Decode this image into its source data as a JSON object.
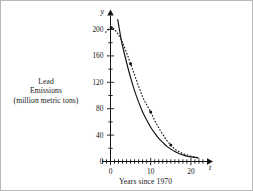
{
  "figure": {
    "background_color": "#ffffff",
    "border_color": "#b9b9b9",
    "left_caption_line1": "Lead",
    "left_caption_line2": "Emissions",
    "left_caption_line3": "(million metric tons)",
    "bottom_caption": "Years since 1970",
    "y_axis_name": "y",
    "x_axis_name": "t"
  },
  "chart_data": {
    "type": "line",
    "title": "",
    "xlabel": "Years since 1970",
    "ylabel": "Lead Emissions (million metric tons)",
    "xlim": [
      -2,
      24
    ],
    "ylim": [
      0,
      215
    ],
    "grid": false,
    "legend": "none",
    "x_ticks_major": [
      0,
      10,
      20
    ],
    "x_tick_labels": [
      "0",
      "10",
      "20"
    ],
    "x_ticks_minor_step": 1,
    "y_ticks_major": [
      0,
      40,
      80,
      120,
      160,
      200
    ],
    "y_tick_labels": [
      "0",
      "40",
      "80",
      "120",
      "160",
      "200"
    ],
    "y_ticks_minor_step": 20,
    "axis_arrow_x": true,
    "axis_arrow_y": true,
    "series": [
      {
        "name": "data-model-curve",
        "style": "dotted",
        "color": "#1a1a1a",
        "x": [
          -1.2,
          -0.4,
          0.2,
          1.0,
          2.0,
          3.0,
          4.0,
          5.0,
          6.0,
          7.0,
          8.0,
          9.0,
          10.0,
          11.0,
          12.0,
          13.0,
          14.0,
          15.0,
          16.0,
          17.0,
          18.0,
          19.0,
          20.0,
          21.0,
          22.0
        ],
        "y": [
          196,
          201,
          203,
          200,
          192,
          180,
          165,
          148,
          131,
          114,
          98,
          86,
          75,
          62,
          51,
          41,
          32,
          25,
          19,
          15,
          12,
          10,
          8,
          7,
          6
        ]
      },
      {
        "name": "exponential-fit-curve",
        "style": "solid",
        "color": "#111111",
        "x": [
          1.8,
          2.5,
          3.0,
          4.0,
          5.0,
          6.0,
          7.0,
          8.0,
          9.0,
          10.0,
          11.0,
          12.0,
          13.0,
          14.0,
          15.0,
          16.0,
          17.0,
          18.0,
          19.0,
          20.0,
          21.0,
          22.0
        ],
        "y": [
          215,
          190,
          175,
          150,
          127,
          107,
          90,
          75,
          63,
          52,
          43,
          35,
          29,
          23,
          19,
          15,
          12,
          10,
          8,
          7,
          6,
          5
        ]
      }
    ],
    "markers": [
      {
        "x": 0.2,
        "y": 203
      },
      {
        "x": 5.0,
        "y": 148
      },
      {
        "x": 10.0,
        "y": 75
      },
      {
        "x": 15.0,
        "y": 25
      }
    ]
  }
}
